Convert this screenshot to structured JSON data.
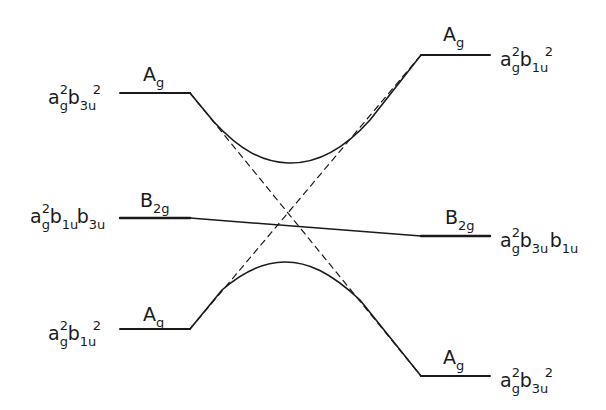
{
  "diagram": {
    "type": "correlation diagram (avoided crossing)",
    "line_color": "#1a1a1a",
    "left_levels": [
      {
        "id": "left-top",
        "configuration": {
          "base1": "a",
          "sub1": "g",
          "sup1": "2",
          "base2": "b",
          "sub2": "3u",
          "sup2": "2"
        },
        "symmetry": {
          "base": "A",
          "sub": "g"
        },
        "y": 93
      },
      {
        "id": "left-middle",
        "configuration": {
          "base1": "a",
          "sub1": "g",
          "sup1": "2",
          "base2": "b",
          "sub2": "1u",
          "base3": "b",
          "sub3": "3u"
        },
        "symmetry": {
          "base": "B",
          "sub": "2g"
        },
        "y": 218
      },
      {
        "id": "left-bottom",
        "configuration": {
          "base1": "a",
          "sub1": "g",
          "sup1": "2",
          "base2": "b",
          "sub2": "1u",
          "sup2": "2"
        },
        "symmetry": {
          "base": "A",
          "sub": "g"
        },
        "y": 329
      }
    ],
    "right_levels": [
      {
        "id": "right-top",
        "configuration": {
          "base1": "a",
          "sub1": "g",
          "sup1": "2",
          "base2": "b",
          "sub2": "1u",
          "sup2": "2"
        },
        "symmetry": {
          "base": "A",
          "sub": "g"
        },
        "y": 55
      },
      {
        "id": "right-middle",
        "configuration": {
          "base1": "a",
          "sub1": "g",
          "sup1": "2",
          "base2": "b",
          "sub2": "3u",
          "base3": "b",
          "sub3": "1u"
        },
        "symmetry": {
          "base": "B",
          "sub": "2g"
        },
        "y": 236
      },
      {
        "id": "right-bottom",
        "configuration": {
          "base1": "a",
          "sub1": "g",
          "sup1": "2",
          "base2": "b",
          "sub2": "3u",
          "sup2": "2"
        },
        "symmetry": {
          "base": "A",
          "sub": "g"
        },
        "y": 376
      }
    ],
    "connections": [
      {
        "from": "left-top",
        "to": "right-top",
        "style": "solid-curve",
        "note": "avoided crossing, upper A_g"
      },
      {
        "from": "left-bottom",
        "to": "right-bottom",
        "style": "solid-curve",
        "note": "avoided crossing, lower A_g"
      },
      {
        "from": "left-middle",
        "to": "right-middle",
        "style": "solid-straight",
        "note": "B_2g correlation"
      },
      {
        "from": "left-top",
        "to": "right-bottom",
        "style": "dashed",
        "note": "diabatic a_g^2 b_3u^2"
      },
      {
        "from": "left-bottom",
        "to": "right-top",
        "style": "dashed",
        "note": "diabatic a_g^2 b_1u^2"
      }
    ]
  }
}
